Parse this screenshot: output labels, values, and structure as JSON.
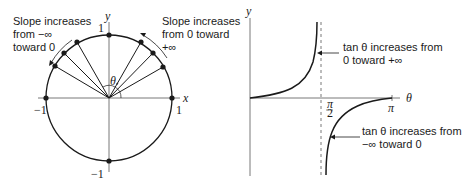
{
  "left_panel": {
    "axis_x": "x",
    "axis_y": "y",
    "angle_label": "θ",
    "tick_top": "1",
    "tick_bottom": "−1",
    "tick_left": "−1",
    "tick_right": "1",
    "annotation_left": [
      "Slope increases",
      "from −∞",
      "toward 0"
    ],
    "annotation_right": [
      "Slope increases",
      "from 0 toward",
      "+∞"
    ]
  },
  "right_panel": {
    "axis_y": "y",
    "axis_x": "θ",
    "tick_half_pi": "π/2",
    "tick_pi": "π",
    "annotation_upper": [
      "tan θ increases from",
      "0 toward +∞"
    ],
    "annotation_lower": [
      "tan θ increases from",
      "−∞ toward 0"
    ]
  },
  "colors": {
    "ink": "#1a1a1a",
    "axis": "#444444"
  }
}
